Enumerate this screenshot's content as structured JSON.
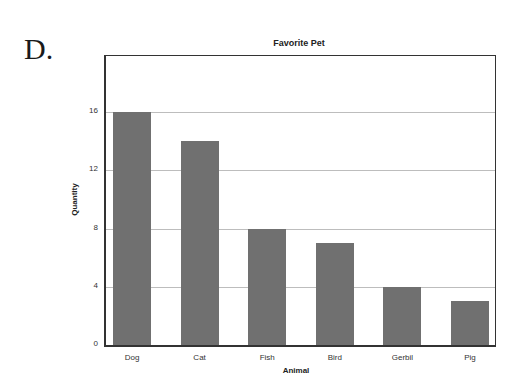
{
  "panel_letter": "D.",
  "chart_data": {
    "type": "bar",
    "title": "Favorite Pet",
    "xlabel": "Animal",
    "ylabel": "Quantity",
    "categories": [
      "Dog",
      "Cat",
      "Fish",
      "Bird",
      "Gerbil",
      "Pig"
    ],
    "values": [
      16,
      14,
      8,
      7,
      4,
      3
    ],
    "yticks": [
      0,
      4,
      8,
      12,
      16
    ],
    "ylim": [
      0,
      19.8
    ],
    "grid": true,
    "legend": null,
    "bar_color": "#707070"
  }
}
